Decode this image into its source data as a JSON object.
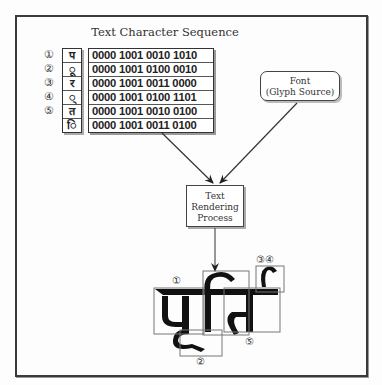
{
  "title": "Text Character Sequence",
  "sequence": {
    "markers": [
      "①",
      "②",
      "③",
      "④",
      "⑤",
      ""
    ],
    "glyphs": [
      "प",
      "ू",
      "र",
      "्",
      "त",
      "ि"
    ],
    "codes": [
      "0000 1001 0010 1010",
      "0000 1001 0100 0010",
      "0000 1001 0011 0000",
      "0000 1001 0100 1101",
      "0000 1001 0010 0100",
      "0000 1001 0011 0100"
    ]
  },
  "font_box": {
    "line1": "Font",
    "line2": "(Glyph Source)"
  },
  "process_box": {
    "line1": "Text",
    "line2": "Rendering",
    "line3": "Process"
  },
  "rendered": {
    "word": "पूर्ति",
    "labels": {
      "one": "①",
      "two": "②",
      "three_four": "③④",
      "five": "⑤"
    }
  },
  "colors": {
    "frame": "#3a3a3a",
    "ink": "#222222",
    "box_outline": "#777777"
  }
}
